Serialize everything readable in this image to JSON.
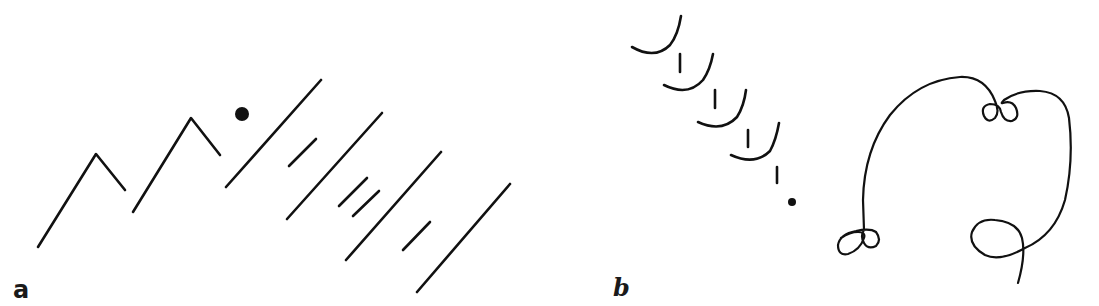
{
  "figure": {
    "panels": [
      {
        "id": "a",
        "label": "a",
        "description": "Zigzag peak strokes, a filled dot, and parallel diagonal long/short strokes",
        "elements": {
          "zigzags": 2,
          "dot": 1,
          "long_diagonal_lines": 4,
          "short_diagonal_dashes": 4
        }
      },
      {
        "id": "b",
        "label": "b",
        "description": "Diagonal sequence of cup-shaped arcs with vertical ticks ending in a dot, plus a looping continuous trajectory with curl loops",
        "elements": {
          "cups": 4,
          "ticks": 5,
          "dot": 1,
          "looping_trajectory": 1,
          "curl_clusters": 3
        }
      }
    ],
    "colors": {
      "ink": "#111111",
      "background": "#ffffff"
    }
  }
}
